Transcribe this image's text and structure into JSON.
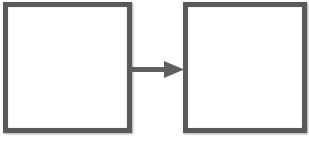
{
  "diagram": {
    "type": "process-flow",
    "nodes": [
      {
        "id": "left",
        "label": ""
      },
      {
        "id": "right",
        "label": ""
      }
    ],
    "edges": [
      {
        "from": "left",
        "to": "right",
        "style": "arrow"
      }
    ],
    "labels_note": "Captions beneath boxes are clipped at image bottom and unreadable",
    "colors": {
      "border": "#5a5a5a",
      "arrow": "#5f5f5f",
      "background": "#ffffff"
    }
  }
}
